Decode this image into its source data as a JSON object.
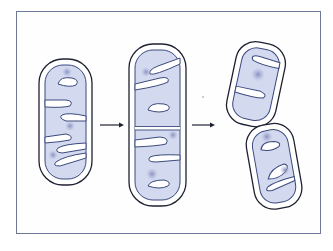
{
  "figure": {
    "title": "Mitochondrial division (fission)",
    "stages": [
      {
        "id": "stage-1",
        "label": "Mitochondrion before division"
      },
      {
        "id": "stage-2",
        "label": "Elongated mitochondrion with septum forming"
      },
      {
        "id": "stage-3",
        "label": "Two daughter mitochondria"
      }
    ],
    "arrows": [
      {
        "id": "arrow-1",
        "label": "→"
      },
      {
        "id": "arrow-2",
        "label": "→"
      }
    ],
    "colors": {
      "frame": "#6d7796",
      "outer_membrane": "#1e2230",
      "inner_membrane": "#3b4a7c",
      "matrix_fill": "#d3d9ef",
      "intermembrane": "#ffffff",
      "dna_nucleoid": "#8d96c2"
    }
  }
}
